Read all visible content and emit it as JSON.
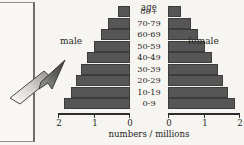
{
  "figure": {
    "title": "age",
    "caption": "numbers / millions",
    "male_label": "male",
    "female_label": "female",
    "side_panel_glyph": "n",
    "colors": {
      "bar_fill": "#565656",
      "bar_stroke": "#3c3c3c",
      "background": "#f6f5f1",
      "text": "#1f1f1f",
      "axis": "#2e2e2e",
      "arrow_light": "#f2f1ee",
      "arrow_dark": "#4a4a4a"
    },
    "icons": {
      "pointer": "arrow-up-right-icon"
    }
  },
  "chart_data": {
    "type": "bar",
    "title": "age",
    "xlabel": "numbers / millions",
    "ylabel": "age",
    "orientation": "horizontal",
    "subtype": "population-pyramid",
    "grid": false,
    "legend_position": "inline-sides",
    "categories": [
      "80+",
      "70-79",
      "60-69",
      "50-59",
      "40-49",
      "30-39",
      "20-29",
      "10-19",
      "0-9"
    ],
    "axis_left": {
      "ticks": [
        "2",
        "1",
        "0"
      ],
      "values": [
        2,
        1,
        0
      ],
      "range": [
        2,
        0
      ],
      "direction": "reversed"
    },
    "axis_right": {
      "ticks": [
        "0",
        "1",
        "2"
      ],
      "values": [
        0,
        1,
        2
      ],
      "range": [
        0,
        2
      ],
      "direction": "normal"
    },
    "series": [
      {
        "name": "male",
        "side": "left",
        "values": [
          0.35,
          0.62,
          0.82,
          1.02,
          1.22,
          1.38,
          1.52,
          1.66,
          1.86
        ]
      },
      {
        "name": "female",
        "side": "right",
        "values": [
          0.38,
          0.64,
          0.84,
          1.04,
          1.24,
          1.4,
          1.54,
          1.68,
          1.88
        ]
      }
    ],
    "units": "millions"
  }
}
